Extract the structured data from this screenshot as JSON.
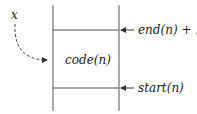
{
  "diagram": {
    "variable_label": "x",
    "cell_label": "code(n)",
    "top_pointer_label": "end(n) + 1",
    "bottom_pointer_label": "start(n)"
  }
}
